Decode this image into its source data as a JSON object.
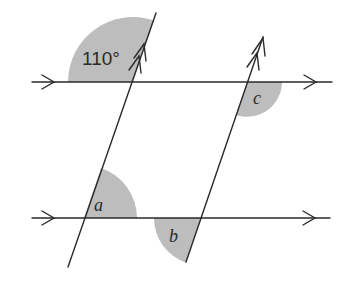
{
  "diagram": {
    "angles": {
      "given": {
        "label": "110°",
        "value_deg": 110
      },
      "a": {
        "label": "a"
      },
      "b": {
        "label": "b"
      },
      "c": {
        "label": "c"
      }
    },
    "lines": {
      "horizontal_parallel_marker": "single-arrow",
      "transversal_parallel_marker": "double-arrow"
    },
    "colors": {
      "stroke": "#2a2a2a",
      "shade": "#bdbdbd",
      "background": "#ffffff"
    }
  }
}
